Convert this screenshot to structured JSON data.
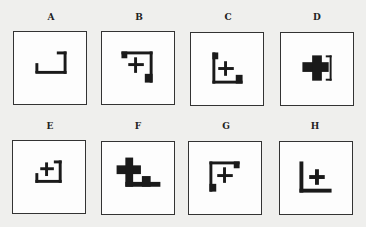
{
  "puzzle": {
    "options": [
      {
        "label": "A",
        "shape": "corner-bracket-bottom-right-open-left"
      },
      {
        "label": "B",
        "shape": "plus-with-top-right-bracket-and-blocks"
      },
      {
        "label": "C",
        "shape": "plus-with-bottom-left-L-and-blocks"
      },
      {
        "label": "D",
        "shape": "bold-cross-with-right-bracket"
      },
      {
        "label": "E",
        "shape": "plus-with-bottom-right-bracket"
      },
      {
        "label": "F",
        "shape": "bold-cross-with-step-base"
      },
      {
        "label": "G",
        "shape": "plus-with-top-left-bracket-and-blocks"
      },
      {
        "label": "H",
        "shape": "plus-with-bottom-left-L"
      }
    ]
  }
}
